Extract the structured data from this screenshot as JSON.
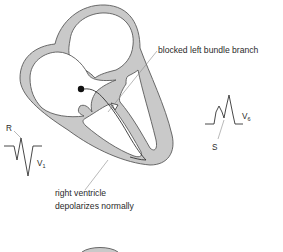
{
  "diagram": {
    "labels": {
      "blocked_branch": "blocked left bundle branch",
      "rv_line1": "right ventricle",
      "rv_line2": "depolarizes normally",
      "v1_r": "R",
      "v1_lead": "V",
      "v1_lead_sub": "1",
      "v6_s": "S",
      "v6_lead": "V",
      "v6_lead_sub": "6"
    },
    "structures": [
      "right atrium",
      "left atrium",
      "right ventricle",
      "left ventricle",
      "interventricular septum",
      "AV node (black dot)",
      "right bundle branch",
      "left bundle branch (blocked)"
    ],
    "ecg_traces": [
      {
        "lead": "V1",
        "pattern": "small R, deep broad S (rS)"
      },
      {
        "lead": "V6",
        "pattern": "broad notched R (M-shaped), S notch labeled"
      }
    ],
    "colors": {
      "wall": "#c9c9c9",
      "outline": "#5a5a5a",
      "text": "#2a2a2a",
      "leader": "#8a8a8a"
    }
  }
}
